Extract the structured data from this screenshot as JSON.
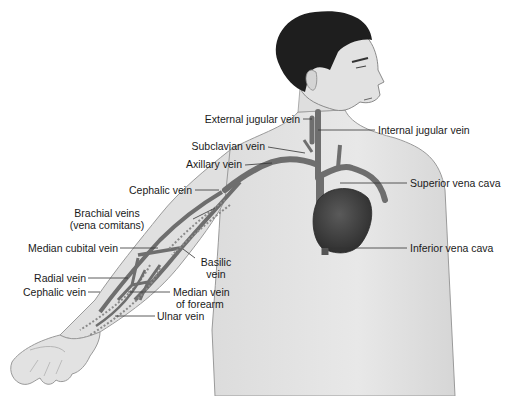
{
  "diagram": {
    "labels": {
      "external_jugular": "External jugular vein",
      "internal_jugular": "Internal jugular vein",
      "subclavian": "Subclavian vein",
      "axillary": "Axillary vein",
      "superior_vena_cava": "Superior vena cava",
      "cephalic_upper": "Cephalic vein",
      "brachial_line1": "Brachial veins",
      "brachial_line2": "(vena comitans)",
      "inferior_vena_cava": "Inferior vena cava",
      "median_cubital": "Median cubital vein",
      "basilic_line1": "Basilic",
      "basilic_line2": "vein",
      "radial": "Radial vein",
      "cephalic_lower": "Cephalic vein",
      "median_forearm_line1": "Median vein",
      "median_forearm_line2": "of forearm",
      "ulnar": "Ulnar vein"
    },
    "colors": {
      "skin": "#e4e4e4",
      "skin_shade": "#cfcfcf",
      "outline": "#8a8a8a",
      "hair": "#1e1e1e",
      "vein": "#6e6e6e",
      "heart": "#3f3f3f",
      "leader_line": "#333333",
      "text": "#1a1a1a"
    }
  }
}
